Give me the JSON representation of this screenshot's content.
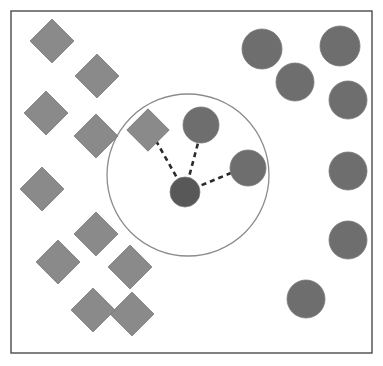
{
  "figure": {
    "background_color": "#ffffff",
    "frame": {
      "name": "plot-frame",
      "x": 11,
      "y": 11,
      "width": 361,
      "height": 342,
      "stroke": "#4a4a4a",
      "stroke_width": 1.4,
      "fill": "#ffffff"
    },
    "neighborhood_circle": {
      "name": "neighborhood-boundary",
      "cx": 188,
      "cy": 175,
      "r": 81,
      "stroke": "#8c8c8c",
      "stroke_width": 1.3,
      "fill": "none"
    }
  },
  "colors": {
    "class_a_diamond": "#8a8a8a",
    "class_b_circle": "#6e6e6e",
    "query_point": "#585858",
    "shape_stroke": "#7a7a7a",
    "link_line": "#2b2b2b",
    "frame_stroke": "#4a4a4a",
    "circle_stroke": "#8c8c8c",
    "background": "#ffffff"
  },
  "chart_data": {
    "type": "scatter",
    "title": "",
    "xlabel": "",
    "ylabel": "",
    "xlim": [
      0,
      383
    ],
    "ylim": [
      0,
      366
    ],
    "grid": false,
    "legend_position": "none",
    "axis_ticks": false,
    "k": 3,
    "series": [
      {
        "name": "class-a",
        "marker": "diamond",
        "color": "#8a8a8a",
        "count": 11,
        "points": [
          {
            "id": "d1",
            "x": 52,
            "y": 41,
            "size": 31,
            "rotation": 45,
            "inside_neighborhood": false
          },
          {
            "id": "d2",
            "x": 97,
            "y": 76,
            "size": 31,
            "rotation": 45,
            "inside_neighborhood": false
          },
          {
            "id": "d3",
            "x": 46,
            "y": 113,
            "size": 31,
            "rotation": 45,
            "inside_neighborhood": false
          },
          {
            "id": "d4",
            "x": 96,
            "y": 136,
            "size": 31,
            "rotation": 45,
            "inside_neighborhood": false
          },
          {
            "id": "d5",
            "x": 148,
            "y": 130,
            "size": 30,
            "rotation": 45,
            "inside_neighborhood": true
          },
          {
            "id": "d6",
            "x": 42,
            "y": 189,
            "size": 31,
            "rotation": 45,
            "inside_neighborhood": false
          },
          {
            "id": "d7",
            "x": 96,
            "y": 234,
            "size": 31,
            "rotation": 45,
            "inside_neighborhood": false
          },
          {
            "id": "d8",
            "x": 58,
            "y": 262,
            "size": 31,
            "rotation": 45,
            "inside_neighborhood": false
          },
          {
            "id": "d9",
            "x": 130,
            "y": 267,
            "size": 31,
            "rotation": 45,
            "inside_neighborhood": false
          },
          {
            "id": "d10",
            "x": 132,
            "y": 314,
            "size": 31,
            "rotation": 45,
            "inside_neighborhood": false
          },
          {
            "id": "d11",
            "x": 93,
            "y": 310,
            "size": 31,
            "rotation": 45,
            "inside_neighborhood": false
          }
        ]
      },
      {
        "name": "class-b",
        "marker": "circle",
        "color": "#6e6e6e",
        "count": 10,
        "points": [
          {
            "id": "c1",
            "x": 262,
            "y": 49,
            "r": 20,
            "inside_neighborhood": false
          },
          {
            "id": "c2",
            "x": 340,
            "y": 46,
            "r": 20,
            "inside_neighborhood": false
          },
          {
            "id": "c3",
            "x": 295,
            "y": 82,
            "r": 19,
            "inside_neighborhood": false
          },
          {
            "id": "c4",
            "x": 348,
            "y": 100,
            "r": 19,
            "inside_neighborhood": false
          },
          {
            "id": "c5",
            "x": 201,
            "y": 125,
            "r": 18,
            "inside_neighborhood": true
          },
          {
            "id": "c6",
            "x": 348,
            "y": 171,
            "r": 19,
            "inside_neighborhood": false
          },
          {
            "id": "c7",
            "x": 248,
            "y": 168,
            "r": 18,
            "inside_neighborhood": true
          },
          {
            "id": "c8",
            "x": 348,
            "y": 240,
            "r": 19,
            "inside_neighborhood": false
          },
          {
            "id": "c9",
            "x": 306,
            "y": 299,
            "r": 19,
            "inside_neighborhood": false
          }
        ]
      },
      {
        "name": "query",
        "marker": "circle",
        "color": "#585858",
        "count": 1,
        "points": [
          {
            "id": "q1",
            "x": 185,
            "y": 192,
            "r": 15,
            "inside_neighborhood": true
          }
        ]
      }
    ],
    "links": [
      {
        "name": "link-to-diamond",
        "from": "q1",
        "to": "d5",
        "x1": 185,
        "y1": 192,
        "x2": 155,
        "y2": 139,
        "style": "dashed"
      },
      {
        "name": "link-to-top-circle",
        "from": "q1",
        "to": "c5",
        "x1": 185,
        "y1": 192,
        "x2": 198,
        "y2": 143,
        "style": "dashed"
      },
      {
        "name": "link-to-right-circle",
        "from": "q1",
        "to": "c7",
        "x1": 185,
        "y1": 192,
        "x2": 231,
        "y2": 173,
        "style": "dashed"
      }
    ]
  }
}
